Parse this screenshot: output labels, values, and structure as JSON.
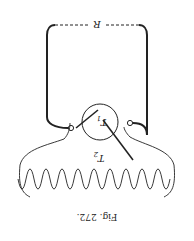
{
  "figure": {
    "caption": "Fig. 272.",
    "orientation": "rotated 180°",
    "labels": {
      "resistance": "R",
      "circle_coil": "T",
      "circle_coil_sub": "1",
      "helix_coil": "T",
      "helix_coil_sub": "2"
    },
    "colors": {
      "ink": "#222222",
      "paper": "#ffffff"
    }
  }
}
